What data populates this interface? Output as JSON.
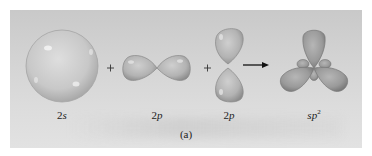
{
  "figure": {
    "caption": "(a)",
    "colors": {
      "background_panel": "#d3d3d3",
      "orbital_fill": "#b8b8b8",
      "orbital_shade": "#8f8f8f",
      "hybrid_fill": "#9a9a9a",
      "text": "#222222"
    },
    "orbitals": [
      {
        "id": "2s",
        "shape": "sphere",
        "label_main": "2",
        "label_ital": "s"
      },
      {
        "id": "2p_horizontal",
        "shape": "dumbbell-horizontal",
        "label_main": "2",
        "label_ital": "p"
      },
      {
        "id": "2p_vertical",
        "shape": "dumbbell-vertical",
        "label_main": "2",
        "label_ital": "p"
      }
    ],
    "operators": [
      "+",
      "+"
    ],
    "arrow": "right-arrow",
    "result": {
      "id": "sp2",
      "shape": "trigonal-planar-hybrid",
      "label_ital": "sp",
      "label_sup": "2"
    }
  }
}
